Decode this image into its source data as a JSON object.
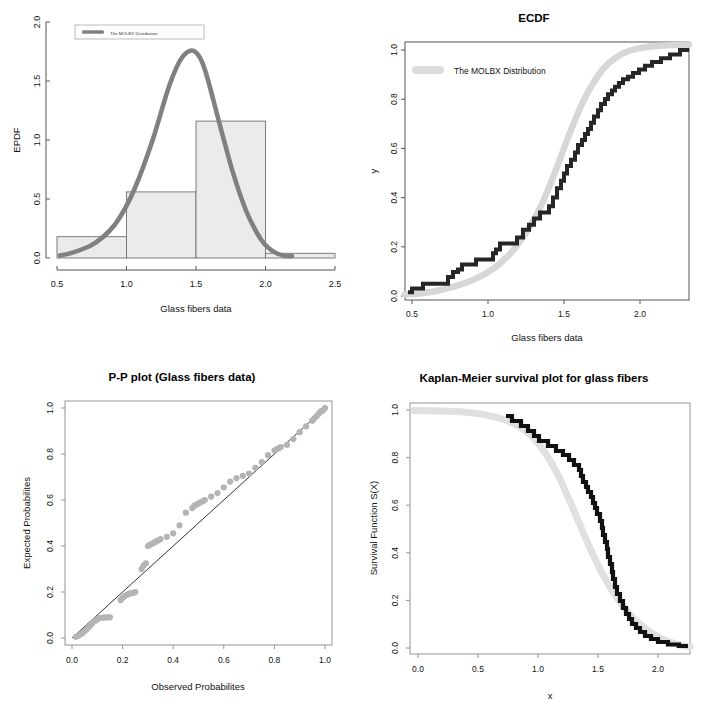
{
  "figure": {
    "name": "glass-fibers-distribution-fit-panels",
    "background": "#ffffff",
    "layout": "2x2 grid of R base-graphics plots",
    "colors": {
      "fit_curve_dark_gray": "#808080",
      "fit_curve_light_gray": "#d9d9d9",
      "empirical_black": "#1a1a1a",
      "histogram_fill": "#ebebeb",
      "histogram_border": "#6e6e6e",
      "axis": "#555555",
      "point_gray": "#b0b0b0"
    },
    "legend_label": "The MOLBX Distribution"
  },
  "panels": [
    {
      "id": "epdf",
      "title": "",
      "legend": "The MOLBX Distribution",
      "chart_data": {
        "type": "bar",
        "title": "",
        "xlabel": "Glass fibers data",
        "ylabel": "EPDF",
        "xlim": [
          0.5,
          2.5
        ],
        "ylim": [
          0.0,
          2.0
        ],
        "xticks": [
          "0.5",
          "1.0",
          "1.5",
          "2.0",
          "2.5"
        ],
        "xtickvals": [
          0.5,
          1.0,
          1.5,
          2.0,
          2.5
        ],
        "yticks": [
          "0.0",
          "0.5",
          "1.0",
          "1.5",
          "2.0"
        ],
        "ytickvals": [
          0.0,
          0.5,
          1.0,
          1.5,
          2.0
        ],
        "grid": false,
        "legend_position": "top-left",
        "histogram": {
          "bin_edges": [
            0.5,
            1.0,
            1.5,
            2.0,
            2.5
          ],
          "densities": [
            0.18,
            0.56,
            1.16,
            0.04
          ]
        },
        "series": [
          {
            "name": "The MOLBX Distribution",
            "type": "line",
            "x": [
              0.52,
              0.6,
              0.7,
              0.8,
              0.9,
              1.0,
              1.06,
              1.12,
              1.18,
              1.24,
              1.3,
              1.36,
              1.42,
              1.48,
              1.54,
              1.58,
              1.62,
              1.66,
              1.72,
              1.78,
              1.84,
              1.9,
              1.96,
              2.02,
              2.08,
              2.14,
              2.2,
              2.26
            ],
            "y": [
              0.02,
              0.03,
              0.05,
              0.09,
              0.14,
              0.21,
              0.27,
              0.35,
              0.45,
              0.58,
              0.74,
              0.92,
              1.12,
              1.32,
              1.5,
              1.555,
              1.55,
              1.5,
              1.34,
              1.12,
              0.88,
              0.64,
              0.44,
              0.28,
              0.17,
              0.1,
              0.05,
              0.03
            ]
          }
        ]
      }
    },
    {
      "id": "ecdf",
      "title": "ECDF",
      "legend": "The MOLBX Distribution",
      "chart_data": {
        "type": "line",
        "title": "ECDF",
        "xlabel": "Glass fibers data",
        "ylabel": "y",
        "xlim": [
          0.45,
          2.32
        ],
        "ylim": [
          0.0,
          1.0
        ],
        "xticks": [
          "0.5",
          "1.0",
          "1.5",
          "2.0"
        ],
        "xtickvals": [
          0.5,
          1.0,
          1.5,
          2.0
        ],
        "yticks": [
          "0.0",
          "0.2",
          "0.4",
          "0.6",
          "0.8",
          "1.0"
        ],
        "ytickvals": [
          0.0,
          0.2,
          0.4,
          0.6,
          0.8,
          1.0
        ],
        "grid": false,
        "legend_position": "top-left",
        "series": [
          {
            "name": "Empirical CDF (step)",
            "type": "step",
            "x": [
              0.55,
              0.62,
              0.74,
              0.77,
              0.81,
              0.84,
              0.93,
              1.04,
              1.11,
              1.13,
              1.24,
              1.28,
              1.29,
              1.3,
              1.36,
              1.39,
              1.42,
              1.48,
              1.5,
              1.5,
              1.51,
              1.52,
              1.53,
              1.54,
              1.55,
              1.58,
              1.59,
              1.6,
              1.61,
              1.61,
              1.62,
              1.62,
              1.63,
              1.64,
              1.66,
              1.66,
              1.66,
              1.67,
              1.68,
              1.68,
              1.69,
              1.7,
              1.7,
              1.73,
              1.76,
              1.76,
              1.77,
              1.78,
              1.81,
              1.82,
              1.84,
              1.84,
              1.89,
              2.0,
              2.01,
              2.24
            ],
            "y": [
              0.015,
              0.03,
              0.05,
              0.07,
              0.09,
              0.1,
              0.12,
              0.14,
              0.155,
              0.17,
              0.22,
              0.245,
              0.27,
              0.285,
              0.31,
              0.335,
              0.36,
              0.4,
              0.44,
              0.47,
              0.5,
              0.53,
              0.56,
              0.59,
              0.615,
              0.64,
              0.66,
              0.69,
              0.71,
              0.735,
              0.76,
              0.785,
              0.8,
              0.82,
              0.84,
              0.86,
              0.875,
              0.885,
              0.9,
              0.915,
              0.925,
              0.935,
              0.945,
              0.95,
              0.955,
              0.96,
              0.965,
              0.97,
              0.972,
              0.975,
              0.978,
              0.98,
              0.982,
              0.985,
              0.99,
              1.0
            ]
          },
          {
            "name": "The MOLBX Distribution",
            "type": "line",
            "x": [
              0.45,
              0.6,
              0.75,
              0.9,
              1.0,
              1.1,
              1.2,
              1.3,
              1.4,
              1.45,
              1.5,
              1.55,
              1.6,
              1.65,
              1.7,
              1.75,
              1.8,
              1.85,
              1.9,
              2.0,
              2.1,
              2.2,
              2.3
            ],
            "y": [
              0.008,
              0.015,
              0.028,
              0.05,
              0.07,
              0.1,
              0.145,
              0.21,
              0.3,
              0.36,
              0.43,
              0.51,
              0.585,
              0.66,
              0.73,
              0.79,
              0.845,
              0.885,
              0.915,
              0.955,
              0.978,
              0.99,
              0.997
            ]
          }
        ]
      }
    },
    {
      "id": "pp-plot",
      "title": "P-P plot (Glass fibers data)",
      "chart_data": {
        "type": "scatter",
        "title": "P-P plot (Glass fibers data)",
        "xlabel": "Observed Probabilites",
        "ylabel": "Expected Probabilites",
        "xlim": [
          -0.03,
          1.03
        ],
        "ylim": [
          -0.03,
          1.03
        ],
        "xticks": [
          "0.0",
          "0.2",
          "0.4",
          "0.6",
          "0.8",
          "1.0"
        ],
        "xtickvals": [
          0.0,
          0.2,
          0.4,
          0.6,
          0.8,
          1.0
        ],
        "yticks": [
          "0.0",
          "0.2",
          "0.4",
          "0.6",
          "0.8",
          "1.0"
        ],
        "ytickvals": [
          0.0,
          0.2,
          0.4,
          0.6,
          0.8,
          1.0
        ],
        "grid": false,
        "reference_line": {
          "from": [
            0,
            0
          ],
          "to": [
            1,
            1
          ]
        },
        "series": [
          {
            "name": "P-P points",
            "x": [
              0.015,
              0.025,
              0.033,
              0.042,
              0.05,
              0.058,
              0.067,
              0.075,
              0.083,
              0.092,
              0.1,
              0.108,
              0.117,
              0.125,
              0.133,
              0.142,
              0.15,
              0.192,
              0.2,
              0.208,
              0.217,
              0.225,
              0.233,
              0.242,
              0.25,
              0.275,
              0.283,
              0.292,
              0.3,
              0.308,
              0.317,
              0.325,
              0.333,
              0.342,
              0.35,
              0.375,
              0.4,
              0.425,
              0.45,
              0.475,
              0.483,
              0.492,
              0.5,
              0.508,
              0.517,
              0.525,
              0.55,
              0.575,
              0.6,
              0.625,
              0.65,
              0.675,
              0.7,
              0.725,
              0.75,
              0.775,
              0.8,
              0.808,
              0.817,
              0.825,
              0.85,
              0.875,
              0.9,
              0.925,
              0.95,
              0.958,
              0.967,
              0.975,
              0.983,
              0.992,
              1.0
            ],
            "y": [
              0.005,
              0.01,
              0.016,
              0.022,
              0.03,
              0.038,
              0.048,
              0.058,
              0.068,
              0.075,
              0.082,
              0.086,
              0.088,
              0.089,
              0.09,
              0.09,
              0.09,
              0.165,
              0.175,
              0.182,
              0.188,
              0.192,
              0.195,
              0.196,
              0.2,
              0.3,
              0.315,
              0.325,
              0.4,
              0.405,
              0.41,
              0.415,
              0.42,
              0.425,
              0.43,
              0.44,
              0.455,
              0.49,
              0.545,
              0.565,
              0.575,
              0.58,
              0.585,
              0.59,
              0.595,
              0.6,
              0.615,
              0.63,
              0.655,
              0.68,
              0.695,
              0.705,
              0.715,
              0.74,
              0.765,
              0.795,
              0.815,
              0.82,
              0.825,
              0.83,
              0.84,
              0.865,
              0.895,
              0.92,
              0.945,
              0.955,
              0.965,
              0.975,
              0.985,
              0.99,
              1.0
            ]
          }
        ]
      }
    },
    {
      "id": "kaplan-meier",
      "title": "Kaplan-Meier survival plot for glass fibers",
      "chart_data": {
        "type": "line",
        "title": "Kaplan-Meier survival plot for glass fibers",
        "xlabel": "x",
        "ylabel": "Survival Function S(X)",
        "xlim": [
          -0.05,
          2.32
        ],
        "ylim": [
          0.0,
          1.02
        ],
        "xticks": [
          "0.0",
          "0.5",
          "1.0",
          "1.5",
          "2.0"
        ],
        "xtickvals": [
          0.0,
          0.5,
          1.0,
          1.5,
          2.0
        ],
        "yticks": [
          "0.0",
          "0.2",
          "0.4",
          "0.6",
          "0.8",
          "1.0"
        ],
        "ytickvals": [
          0.0,
          0.2,
          0.4,
          0.6,
          0.8,
          1.0
        ],
        "grid": false,
        "series": [
          {
            "name": "Kaplan-Meier estimate (step)",
            "type": "step",
            "x": [
              0.0,
              0.74,
              0.77,
              0.81,
              0.84,
              0.93,
              1.04,
              1.11,
              1.13,
              1.24,
              1.28,
              1.29,
              1.3,
              1.36,
              1.39,
              1.42,
              1.48,
              1.5,
              1.51,
              1.53,
              1.55,
              1.58,
              1.61,
              1.62,
              1.63,
              1.64,
              1.66,
              1.68,
              1.7,
              1.73,
              1.76,
              1.78,
              1.81,
              1.84,
              1.89,
              2.0,
              2.24,
              2.3
            ],
            "y": [
              1.0,
              0.975,
              0.96,
              0.945,
              0.93,
              0.915,
              0.9,
              0.885,
              0.87,
              0.855,
              0.84,
              0.8,
              0.77,
              0.76,
              0.745,
              0.73,
              0.7,
              0.67,
              0.635,
              0.6,
              0.565,
              0.53,
              0.49,
              0.455,
              0.42,
              0.385,
              0.34,
              0.3,
              0.26,
              0.22,
              0.185,
              0.15,
              0.12,
              0.095,
              0.06,
              0.035,
              0.015,
              0.0
            ]
          },
          {
            "name": "The MOLBX Distribution",
            "type": "line",
            "x": [
              0.0,
              0.3,
              0.5,
              0.65,
              0.8,
              0.9,
              1.0,
              1.1,
              1.2,
              1.3,
              1.4,
              1.45,
              1.5,
              1.55,
              1.6,
              1.65,
              1.7,
              1.75,
              1.8,
              1.85,
              1.9,
              2.0,
              2.1,
              2.2,
              2.3
            ],
            "y": [
              0.998,
              0.995,
              0.99,
              0.985,
              0.975,
              0.965,
              0.945,
              0.91,
              0.86,
              0.79,
              0.7,
              0.645,
              0.575,
              0.495,
              0.415,
              0.34,
              0.27,
              0.21,
              0.155,
              0.115,
              0.085,
              0.045,
              0.022,
              0.01,
              0.004
            ]
          }
        ]
      }
    }
  ]
}
